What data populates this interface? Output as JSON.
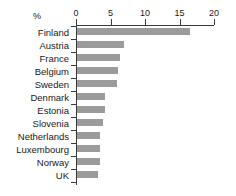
{
  "chart_data": {
    "type": "bar",
    "orientation": "horizontal",
    "title": "",
    "xlabel": "%",
    "ylabel": "",
    "xlim": [
      0,
      20
    ],
    "xticks": [
      0,
      5,
      10,
      15,
      20
    ],
    "grid": false,
    "legend": false,
    "bar_color": "#9b9b9b",
    "axis_color": "#3a3a3a",
    "categories": [
      "Finland",
      "Austria",
      "France",
      "Belgium",
      "Sweden",
      "Denmark",
      "Estonia",
      "Slovenia",
      "Netherlands",
      "Luxembourg",
      "Norway",
      "UK"
    ],
    "values": [
      16.5,
      6.9,
      6.4,
      6.1,
      6.0,
      4.2,
      4.2,
      3.9,
      3.5,
      3.5,
      3.5,
      3.2
    ],
    "unit": "%"
  }
}
